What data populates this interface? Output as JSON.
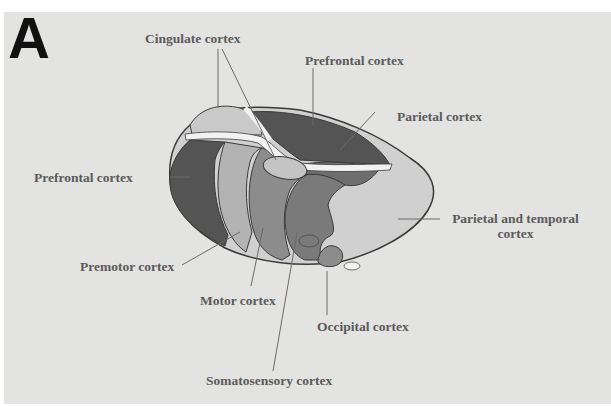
{
  "figure": {
    "panel_letter": "A",
    "background_color": "#e3e3e1",
    "colors": {
      "prefrontal": "#545454",
      "premotor": "#b3b3b3",
      "motor": "#8c8c8c",
      "somatosensory": "#7a7a7a",
      "parietal_temporal": "#d0d0d0",
      "cingulate": "#c9c9c9",
      "corpus_callosum": "#f2f2f2",
      "outline": "#3a3a3a"
    },
    "labels": {
      "cingulate": "Cingulate cortex",
      "prefrontal_top": "Prefrontal cortex",
      "parietal": "Parietal cortex",
      "prefrontal_left": "Prefrontal cortex",
      "parietal_temporal_line1": "Parietal and temporal",
      "parietal_temporal_line2": "cortex",
      "premotor": "Premotor cortex",
      "motor": "Motor cortex",
      "occipital": "Occipital cortex",
      "somatosensory": "Somatosensory cortex"
    }
  }
}
